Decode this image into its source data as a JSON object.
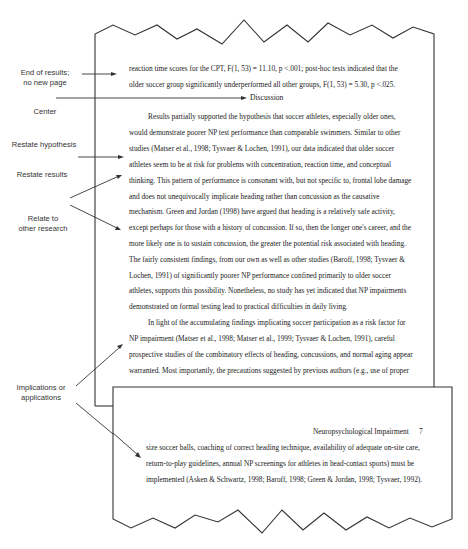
{
  "annotations": [
    {
      "id": "end-of-results",
      "lines": [
        "End of results;",
        "no new page"
      ]
    },
    {
      "id": "center",
      "lines": [
        "Center"
      ]
    },
    {
      "id": "restate-hypothesis",
      "lines": [
        "Restate hypothesis"
      ]
    },
    {
      "id": "restate-results",
      "lines": [
        "Restate results"
      ]
    },
    {
      "id": "relate-research",
      "lines": [
        "Relate to",
        "other research"
      ]
    },
    {
      "id": "implications",
      "lines": [
        "Implications or",
        "applications"
      ]
    }
  ],
  "back_page": {
    "results_lines": [
      "reaction time scores for the CPT, F(1, 53) = 11.10, p <.001; post-hoc tests indicated that the",
      "older soccer group significantly underperformed all other groups, F(1, 53) = 5.30, p <.025."
    ],
    "heading": "Discussion",
    "body_lines": [
      "Results partially supported the hypothesis that soccer athletes, especially older ones,",
      "would demonstrate poorer NP test performance than comparable swimmers. Similar to other",
      "studies (Matser et al., 1998; Tysvaer & Lochen, 1991), our data indicated that older soccer",
      "athletes seem to be at risk for problems with concentration, reaction time, and conceptual",
      "thinking. This pattern of performance is consonant with, but not specific to, frontal lobe damage",
      "and does not unequivocally implicate heading rather than concussion as the causative",
      "mechanism. Green and Jordan (1998) have argued that heading is a relatively safe activity,",
      "except perhaps for those with a history of concussion. If so, then the longer one's career, and the",
      "more likely one is to sustain concussion, the greater the potential risk associated with heading.",
      "The fairly consistent findings, from our own as well as other studies (Baroff, 1998; Tysvaer &",
      "Lochen, 1991) of significantly poorer NP performance confined primarily to older soccer",
      "athletes, supports this possibility. Nonetheless, no study has yet indicated that NP impairments",
      "demonstrated on formal testing lead to practical difficulties in daily living.",
      "In light of the accumulating findings implicating soccer participation as a risk factor for",
      "NP impairment (Matser et al., 1998; Matser et al., 1999; Tysvaer & Lochen, 1991), careful",
      "prospective studies of the combinatory effects of heading, concussions, and normal aging appear",
      "warranted. Most importantly, the precautions suggested by previous authors (e.g., use of proper"
    ]
  },
  "front_page": {
    "running_head": "Neuropsychological Impairment",
    "page_number": "7",
    "body_lines": [
      "size soccer balls, coaching of correct heading technique, availability of adequate on-site care,",
      "return-to-play guidelines, annual NP screenings for athletes in head-contact sports) must be",
      "implemented (Asken & Schwartz, 1998; Baroff, 1998; Green & Jordan, 1998; Tysvaer, 1992)."
    ]
  },
  "colors": {
    "line": "#333333",
    "text": "#222222",
    "label": "#333333"
  }
}
